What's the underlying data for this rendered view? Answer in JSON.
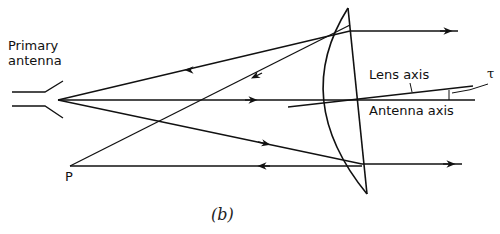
{
  "labels": {
    "primary_antenna_line1": "Primary",
    "primary_antenna_line2": "antenna",
    "lens_axis": "Lens axis",
    "antenna_axis": "Antenna axis",
    "angle_symbol": "τ",
    "point_p": "P",
    "caption": "(b)"
  },
  "colors": {
    "ink": "#111111",
    "background": "#ffffff"
  }
}
